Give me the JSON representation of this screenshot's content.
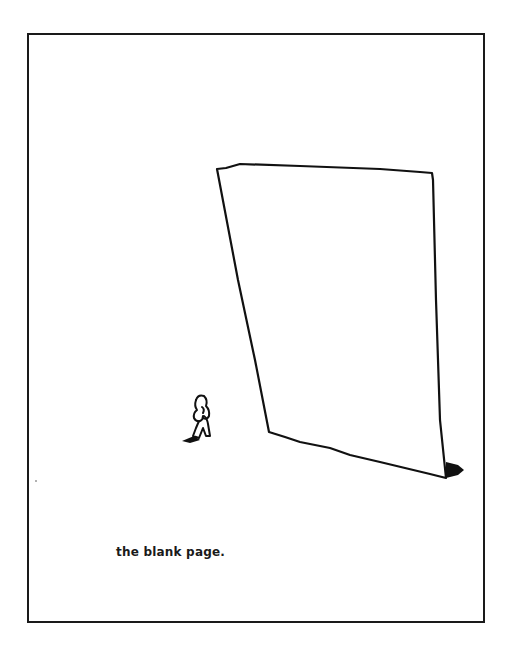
{
  "cartoon": {
    "caption": "the blank page.",
    "subject": "small figure standing before a giant blank sheet of paper",
    "colors": {
      "ink": "#111111",
      "background": "#ffffff"
    }
  }
}
